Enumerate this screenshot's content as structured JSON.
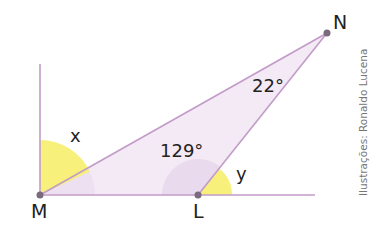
{
  "diagram": {
    "vertices": {
      "M": {
        "label": "M",
        "x": 40,
        "y": 195
      },
      "L": {
        "label": "L",
        "x": 198,
        "y": 195
      },
      "N": {
        "label": "N",
        "x": 327,
        "y": 33
      }
    },
    "angles": {
      "x": {
        "label": "x"
      },
      "y": {
        "label": "y"
      },
      "L_interior": {
        "label": "129°"
      },
      "N_interior": {
        "label": "22°"
      }
    },
    "credit": "Ilustrações: Ronaldo Lucena",
    "colors": {
      "line": "#c39bc9",
      "fill": "#f3eaf5",
      "angle_highlight": "#f7f07a",
      "interior_arc": "#e9dcee",
      "point": "#7a6a7e"
    }
  }
}
